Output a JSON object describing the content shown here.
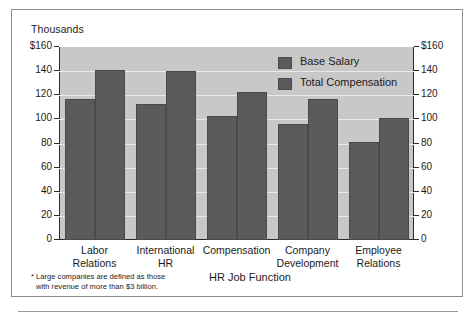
{
  "chart_data": {
    "type": "bar",
    "title": "",
    "units_caption": "Thousands",
    "xlabel": "HR Job Function",
    "ylabel": "",
    "ylim": [
      0,
      160
    ],
    "grid": true,
    "legend_position": "top-right",
    "categories": [
      "Labor Relations",
      "International HR",
      "Compensation",
      "Company Development",
      "Employee Relations"
    ],
    "category_lines": [
      [
        "Labor",
        "Relations"
      ],
      [
        "International",
        "HR"
      ],
      [
        "Compensation",
        ""
      ],
      [
        "Company",
        "Development"
      ],
      [
        "Employee",
        "Relations"
      ]
    ],
    "series": [
      {
        "name": "Base Salary",
        "values": [
          117,
          113,
          103,
          96,
          81
        ]
      },
      {
        "name": "Total Compensation",
        "values": [
          141,
          140,
          123,
          117,
          101
        ]
      }
    ],
    "y_ticks": [
      {
        "value": 160,
        "label_left": "$160",
        "label_right": "$160"
      },
      {
        "value": 140,
        "label_left": "140",
        "label_right": "140"
      },
      {
        "value": 120,
        "label_left": "120",
        "label_right": "120"
      },
      {
        "value": 100,
        "label_left": "100",
        "label_right": "100"
      },
      {
        "value": 80,
        "label_left": "80",
        "label_right": "80"
      },
      {
        "value": 60,
        "label_left": "60",
        "label_right": "60"
      },
      {
        "value": 40,
        "label_left": "40",
        "label_right": "40"
      },
      {
        "value": 20,
        "label_left": "20",
        "label_right": "20"
      },
      {
        "value": 0,
        "label_left": "0",
        "label_right": "0"
      }
    ],
    "footnote": {
      "line1": "* Large companies are defined as those",
      "line2": "with revenue of more than $3 billion."
    },
    "colors": {
      "bar_fill": "#5b5b5b",
      "bar_edge": "#4a4a4a",
      "plot_background": "#c8c8c8",
      "gridline": "#eaeaea",
      "axis": "#2b2b2b",
      "text": "#1b1b1b",
      "frame": "#8c8c8c",
      "page_background": "#ffffff"
    }
  }
}
